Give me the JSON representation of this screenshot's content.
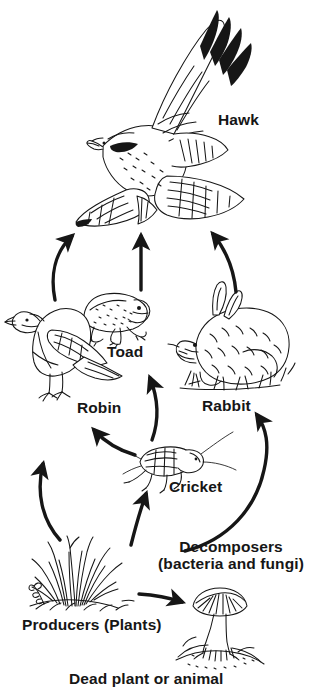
{
  "diagram": {
    "type": "food-web",
    "background_color": "#ffffff",
    "ink_color": "#161616",
    "labels": {
      "hawk": "Hawk",
      "toad": "Toad",
      "robin": "Robin",
      "rabbit": "Rabbit",
      "cricket": "Cricket",
      "decomposers_line1": "Decomposers",
      "decomposers_line2": "(bacteria and fungi)",
      "producers": "Producers (Plants)",
      "dead_matter": "Dead plant or animal"
    },
    "organisms": [
      {
        "id": "hawk",
        "label": "Hawk",
        "role": "tertiary-consumer",
        "illustration": "hawk-flying-wings-spread"
      },
      {
        "id": "toad",
        "label": "Toad",
        "role": "secondary-consumer",
        "illustration": "toad-sitting"
      },
      {
        "id": "robin",
        "label": "Robin",
        "role": "secondary-consumer",
        "illustration": "robin-perched"
      },
      {
        "id": "rabbit",
        "label": "Rabbit",
        "role": "primary-consumer",
        "illustration": "rabbit-sitting-in-grass"
      },
      {
        "id": "cricket",
        "label": "Cricket",
        "role": "primary-consumer",
        "illustration": "cricket-side-view"
      },
      {
        "id": "producers",
        "label": "Producers (Plants)",
        "role": "producer",
        "illustration": "grass-tuft"
      },
      {
        "id": "decomposers",
        "label": "Decomposers (bacteria and fungi)",
        "role": "decomposer",
        "illustration": "mushroom-on-mound"
      },
      {
        "id": "dead_matter",
        "label": "Dead plant or animal",
        "role": "detritus",
        "illustration": "caption-only"
      }
    ],
    "arrows": [
      {
        "from": "robin",
        "to": "hawk",
        "style": "curved"
      },
      {
        "from": "toad",
        "to": "hawk",
        "style": "straight"
      },
      {
        "from": "rabbit",
        "to": "hawk",
        "style": "curved"
      },
      {
        "from": "cricket",
        "to": "toad",
        "style": "curved"
      },
      {
        "from": "cricket",
        "to": "robin",
        "style": "curved"
      },
      {
        "from": "producers",
        "to": "robin",
        "style": "curved-long"
      },
      {
        "from": "producers",
        "to": "cricket",
        "style": "straight"
      },
      {
        "from": "decomposers",
        "to": "rabbit",
        "style": "curved-long"
      },
      {
        "from": "producers",
        "to": "decomposers",
        "style": "straight-horizontal"
      }
    ]
  }
}
